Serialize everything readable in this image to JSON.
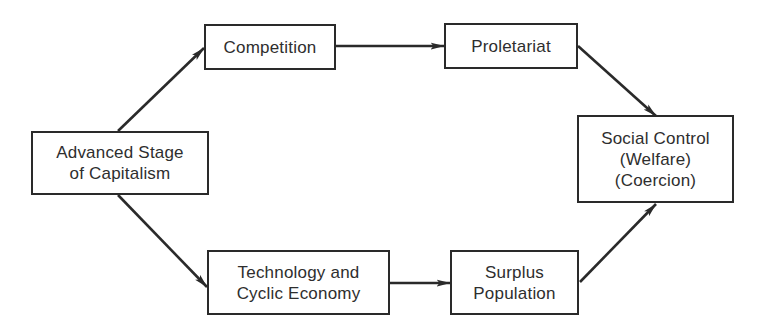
{
  "diagram": {
    "nodes": [
      {
        "id": "advanced",
        "lines": [
          "Advanced Stage",
          "of Capitalism"
        ]
      },
      {
        "id": "competition",
        "lines": [
          "Competition"
        ]
      },
      {
        "id": "proletariat",
        "lines": [
          "Proletariat"
        ]
      },
      {
        "id": "social_control",
        "lines": [
          "Social Control",
          "(Welfare)",
          "(Coercion)"
        ]
      },
      {
        "id": "technology",
        "lines": [
          "Technology and",
          "Cyclic Economy"
        ]
      },
      {
        "id": "surplus",
        "lines": [
          "Surplus",
          "Population"
        ]
      }
    ],
    "edges": [
      {
        "from": "Advanced Stage of Capitalism",
        "to": "Competition"
      },
      {
        "from": "Competition",
        "to": "Proletariat"
      },
      {
        "from": "Proletariat",
        "to": "Social Control (Welfare) (Coercion)"
      },
      {
        "from": "Advanced Stage of Capitalism",
        "to": "Technology and Cyclic Economy"
      },
      {
        "from": "Technology and Cyclic Economy",
        "to": "Surplus Population"
      },
      {
        "from": "Surplus Population",
        "to": "Social Control (Welfare) (Coercion)"
      }
    ],
    "colors": {
      "line": "#2a2a2a",
      "text": "#2e2e2e",
      "background": "#ffffff"
    }
  }
}
